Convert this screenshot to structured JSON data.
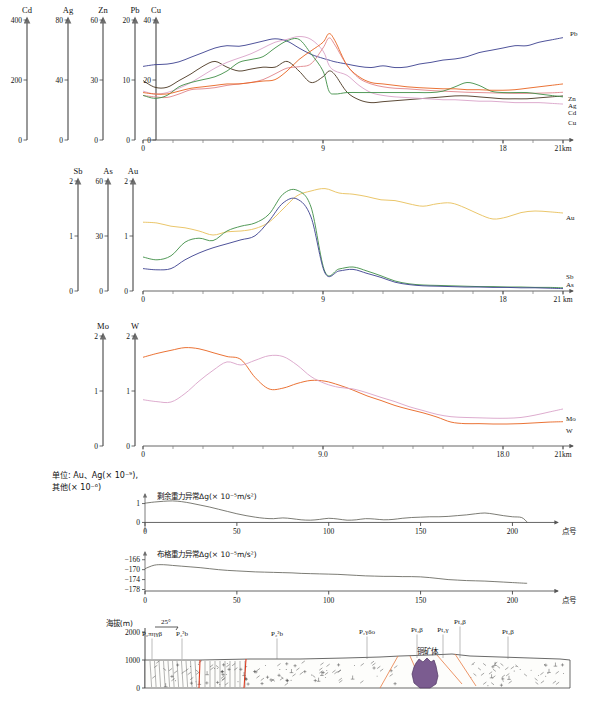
{
  "figure": {
    "units_caption_line1": "单位: Au、Ag(× 10⁻⁹),",
    "units_caption_line2": "其他(× 10⁻⁶)"
  },
  "chart_data": [
    {
      "id": "panel1",
      "type": "line",
      "title": "",
      "xlabel": "21km",
      "xlim": [
        0,
        21
      ],
      "xticks": [
        0,
        9,
        18,
        21
      ],
      "xticklabels": [
        "0",
        "9",
        "18",
        "21km"
      ],
      "grid": false,
      "legend_position": "right-inline",
      "axes": [
        {
          "name": "Cd",
          "ticks": [
            0,
            200,
            400
          ],
          "color": "#f3a6b0"
        },
        {
          "name": "Ag",
          "ticks": [
            0,
            40,
            80
          ],
          "color": "#d9a3c8"
        },
        {
          "name": "Zn",
          "ticks": [
            0,
            30,
            60
          ],
          "color": "#4a3520"
        },
        {
          "name": "Pb",
          "ticks": [
            0,
            10,
            20
          ],
          "color": "#3b3f8f"
        },
        {
          "name": "Cu",
          "ticks": [
            0,
            20,
            40
          ],
          "color": "#3f8f46"
        }
      ],
      "x": [
        0,
        0.6,
        1.2,
        1.8,
        2.4,
        3,
        3.6,
        4.2,
        4.8,
        5.4,
        6,
        6.6,
        7.2,
        7.8,
        8.4,
        9,
        9.3,
        9.6,
        10.2,
        10.8,
        11.4,
        12,
        12.6,
        13.2,
        13.8,
        14.4,
        15,
        15.6,
        16.2,
        16.8,
        17.4,
        18,
        18.6,
        19.2,
        19.8,
        20.4,
        21
      ],
      "series": [
        {
          "name": "Pb",
          "color": "#3b3f8f",
          "axis": "Pb",
          "values": [
            12.8,
            13.1,
            13.2,
            13.6,
            14.4,
            15.2,
            16.0,
            16.4,
            16.3,
            16.7,
            17.2,
            17.6,
            17.2,
            16.0,
            14.9,
            14.2,
            13.9,
            13.6,
            13.2,
            12.8,
            12.6,
            12.9,
            12.6,
            12.7,
            13.2,
            13.5,
            13.9,
            14.1,
            14.5,
            15.2,
            15.6,
            16.0,
            16.4,
            16.4,
            17.0,
            17.4,
            17.8
          ]
        },
        {
          "name": "Zn",
          "color": "#4a3520",
          "axis": "Zn",
          "values": [
            31,
            27.5,
            27.5,
            31,
            34.5,
            38.5,
            41,
            38,
            36,
            37,
            38,
            38,
            41,
            36,
            30,
            33,
            36,
            34,
            25,
            21,
            19.5,
            20,
            20.5,
            21,
            21.5,
            22,
            22.5,
            23,
            23,
            22.5,
            22,
            21.5,
            21.5,
            21.5,
            22,
            22.5,
            23
          ]
        },
        {
          "name": "Ag",
          "color": "#d9a3c8",
          "axis": "Ag",
          "values": [
            34,
            32,
            33,
            36,
            40,
            45,
            50,
            54,
            57,
            60,
            64,
            68,
            70,
            72,
            70,
            62,
            52,
            48,
            45,
            38,
            33,
            31,
            30,
            29.5,
            29,
            28.5,
            28,
            28,
            27.5,
            27,
            27,
            26.5,
            26,
            26,
            26,
            25.5,
            25
          ]
        },
        {
          "name": "Cd",
          "color": "#e0848a",
          "axis": "Cd",
          "values": [
            155,
            150,
            148,
            160,
            175,
            178,
            182,
            190,
            195,
            200,
            210,
            230,
            250,
            255,
            265,
            320,
            355,
            330,
            260,
            215,
            195,
            185,
            180,
            178,
            175,
            172,
            170,
            168,
            166,
            165,
            164,
            163,
            162,
            162,
            163,
            164,
            166
          ]
        },
        {
          "name": "Cu",
          "color": "#3f8f46",
          "axis": "Cu",
          "values": [
            15.5,
            14.5,
            15.5,
            18.5,
            20,
            21,
            22,
            24,
            27,
            28,
            29,
            32,
            34.5,
            35,
            30,
            24,
            17,
            16,
            16.5,
            16.5,
            16.5,
            16.5,
            16.5,
            16.5,
            16.5,
            16.5,
            17,
            18.5,
            20,
            19,
            17,
            16.5,
            16.5,
            16.5,
            16,
            15.5,
            15
          ]
        },
        {
          "name": "CuOrange",
          "color": "#e8631f",
          "axis": "Cu",
          "values": [
            16.5,
            16.0,
            16.0,
            17.0,
            18.0,
            18.5,
            19.0,
            19.5,
            19.5,
            20,
            20.5,
            21,
            24,
            28,
            31,
            34,
            37,
            34.5,
            26,
            22,
            20,
            19.5,
            19,
            18.5,
            18.2,
            18,
            17.8,
            17.8,
            17.5,
            17.5,
            17.3,
            17.3,
            17.5,
            18,
            18.5,
            19,
            19.5
          ]
        }
      ],
      "series_labels": [
        {
          "text": "Pb",
          "color": "#3b3f8f"
        },
        {
          "text": "Zn",
          "color": "#4a3520"
        },
        {
          "text": "Ag",
          "color": "#d9a3c8"
        },
        {
          "text": "Cd",
          "color": "#e0848a"
        },
        {
          "text": "Cu",
          "color": "#3f8f46"
        }
      ]
    },
    {
      "id": "panel2",
      "type": "line",
      "xlabel": "21 km",
      "xlim": [
        0,
        21
      ],
      "xticks": [
        0,
        9,
        18,
        21
      ],
      "xticklabels": [
        "0",
        "9",
        "18",
        "21 km"
      ],
      "grid": false,
      "axes": [
        {
          "name": "Sb",
          "ticks": [
            0,
            1,
            2
          ]
        },
        {
          "name": "As",
          "ticks": [
            0,
            30,
            60
          ]
        },
        {
          "name": "Au",
          "ticks": [
            0,
            1,
            2
          ]
        }
      ],
      "x": [
        0,
        0.7,
        1.4,
        2.1,
        2.8,
        3.5,
        4.2,
        4.9,
        5.6,
        6.3,
        7,
        7.7,
        8.4,
        9.1,
        9.8,
        10.5,
        11.2,
        11.9,
        12.6,
        13.3,
        14,
        14.7,
        15.4,
        16.1,
        16.8,
        17.5,
        18.2,
        18.9,
        19.6,
        20.3,
        21
      ],
      "series": [
        {
          "name": "Au",
          "color": "#e8c05a",
          "axis": "Au",
          "values": [
            1.72,
            1.7,
            1.62,
            1.58,
            1.5,
            1.4,
            1.48,
            1.5,
            1.56,
            1.72,
            2.05,
            2.38,
            2.5,
            2.56,
            2.45,
            2.42,
            2.36,
            2.28,
            2.26,
            2.18,
            2.12,
            2.18,
            2.2,
            2.08,
            1.92,
            1.8,
            1.85,
            1.96,
            2.0,
            1.98,
            1.95
          ]
        },
        {
          "name": "Sb",
          "color": "#3f8f46",
          "axis": "Sb",
          "values": [
            0.85,
            0.78,
            0.88,
            1.22,
            1.32,
            1.26,
            1.5,
            1.62,
            1.7,
            1.92,
            2.42,
            2.52,
            2.1,
            0.48,
            0.55,
            0.6,
            0.5,
            0.38,
            0.25,
            0.18,
            0.15,
            0.14,
            0.13,
            0.12,
            0.11,
            0.11,
            0.1,
            0.1,
            0.09,
            0.09,
            0.08
          ]
        },
        {
          "name": "As",
          "color": "#3b3f8f",
          "axis": "As",
          "values": [
            0.56,
            0.53,
            0.56,
            0.78,
            0.95,
            1.08,
            1.18,
            1.28,
            1.38,
            1.75,
            2.2,
            2.3,
            1.85,
            0.45,
            0.5,
            0.54,
            0.44,
            0.34,
            0.22,
            0.16,
            0.13,
            0.12,
            0.11,
            0.1,
            0.1,
            0.09,
            0.09,
            0.08,
            0.08,
            0.07,
            0.06
          ]
        }
      ],
      "series_labels": [
        {
          "text": "Au",
          "color": "#e8a93a"
        },
        {
          "text": "Sb",
          "color": "#3f8f46"
        },
        {
          "text": "As",
          "color": "#3b3f8f"
        }
      ]
    },
    {
      "id": "panel3",
      "type": "line",
      "xlabel": "21km",
      "xlim": [
        0,
        21
      ],
      "xticks": [
        0,
        9,
        18,
        21
      ],
      "xticklabels": [
        "0",
        "9.0",
        "18.0",
        "21km"
      ],
      "grid": false,
      "axes": [
        {
          "name": "Mo",
          "ticks": [
            0,
            1,
            2
          ]
        },
        {
          "name": "W",
          "ticks": [
            0,
            1,
            2
          ]
        }
      ],
      "x": [
        0,
        0.7,
        1.4,
        2.1,
        2.8,
        3.5,
        4.2,
        4.9,
        5.6,
        6.3,
        7,
        7.7,
        8.4,
        9.1,
        9.8,
        10.5,
        11.2,
        11.9,
        12.6,
        13.3,
        14,
        14.7,
        15.4,
        16.1,
        16.8,
        17.5,
        18.2,
        18.9,
        19.6,
        20.3,
        21
      ],
      "series": [
        {
          "name": "W",
          "color": "#e8631f",
          "axis": "W",
          "values": [
            2.3,
            2.4,
            2.48,
            2.55,
            2.52,
            2.42,
            2.32,
            2.24,
            1.78,
            1.48,
            1.5,
            1.62,
            1.7,
            1.68,
            1.58,
            1.45,
            1.3,
            1.18,
            1.05,
            0.95,
            0.86,
            0.75,
            0.62,
            0.58,
            0.58,
            0.57,
            0.57,
            0.58,
            0.6,
            0.62,
            0.63
          ]
        },
        {
          "name": "Mo",
          "color": "#d9a3c8",
          "axis": "Mo",
          "values": [
            1.2,
            1.15,
            1.14,
            1.36,
            1.68,
            1.96,
            2.18,
            2.1,
            2.22,
            2.34,
            2.32,
            2.1,
            1.8,
            1.62,
            1.52,
            1.48,
            1.38,
            1.26,
            1.15,
            1.02,
            0.92,
            0.82,
            0.76,
            0.74,
            0.73,
            0.72,
            0.72,
            0.74,
            0.8,
            0.88,
            0.96
          ]
        }
      ],
      "series_labels": [
        {
          "text": "Mo",
          "color": "#d9a3c8"
        },
        {
          "text": "W",
          "color": "#e8631f"
        }
      ]
    },
    {
      "id": "panel4",
      "type": "line",
      "title": "剩余重力异常Δg(× 10⁻⁵m/s²)",
      "xlabel": "点号",
      "xlim": [
        0,
        215
      ],
      "ylim": [
        -0.4,
        1.4
      ],
      "xticks": [
        0,
        50,
        100,
        150,
        200
      ],
      "xticklabels": [
        "0",
        "50",
        "100",
        "150",
        "200"
      ],
      "yticks": [
        0,
        1
      ],
      "yticklabels": [
        "0",
        "1"
      ],
      "grid": false,
      "series": [
        {
          "name": "residual-gravity",
          "color": "#5a5a52",
          "x": [
            0,
            5,
            10,
            15,
            20,
            25,
            30,
            35,
            40,
            45,
            50,
            55,
            60,
            65,
            70,
            75,
            80,
            85,
            90,
            95,
            100,
            105,
            110,
            115,
            120,
            125,
            130,
            135,
            140,
            145,
            150,
            155,
            160,
            165,
            170,
            175,
            180,
            185,
            190,
            195,
            200,
            205,
            208
          ],
          "values": [
            1.02,
            1.08,
            1.12,
            1.14,
            1.1,
            1.02,
            0.92,
            0.82,
            0.7,
            0.58,
            0.46,
            0.36,
            0.28,
            0.22,
            0.2,
            0.24,
            0.2,
            0.14,
            0.12,
            0.16,
            0.22,
            0.18,
            0.12,
            0.14,
            0.2,
            0.18,
            0.14,
            0.16,
            0.22,
            0.26,
            0.28,
            0.3,
            0.3,
            0.32,
            0.36,
            0.4,
            0.46,
            0.5,
            0.44,
            0.36,
            0.3,
            0.26,
            0.02
          ]
        }
      ]
    },
    {
      "id": "panel5",
      "type": "line",
      "title": "布格重力异常Δg(× 10⁻⁵m/s²)",
      "xlabel": "点号",
      "xlim": [
        0,
        215
      ],
      "ylim": [
        -179,
        -164.5
      ],
      "xticks": [
        0,
        50,
        100,
        150,
        200
      ],
      "xticklabels": [
        "0",
        "50",
        "100",
        "150",
        "200"
      ],
      "yticks": [
        -166,
        -170,
        -174,
        -178
      ],
      "yticklabels": [
        "−166",
        "−170",
        "−174",
        "−178"
      ],
      "grid": false,
      "series": [
        {
          "name": "bouguer-gravity",
          "color": "#5a5a52",
          "x": [
            0,
            5,
            10,
            15,
            20,
            25,
            30,
            35,
            40,
            45,
            50,
            55,
            60,
            65,
            70,
            75,
            80,
            85,
            90,
            95,
            100,
            105,
            110,
            115,
            120,
            125,
            130,
            135,
            140,
            145,
            150,
            155,
            160,
            165,
            170,
            175,
            180,
            185,
            190,
            195,
            200,
            205,
            208
          ],
          "values": [
            -169.6,
            -168.2,
            -168.0,
            -168.3,
            -168.6,
            -168.9,
            -169.2,
            -169.6,
            -170.0,
            -170.3,
            -170.5,
            -170.7,
            -170.9,
            -171.0,
            -171.1,
            -171.2,
            -171.3,
            -171.5,
            -171.6,
            -171.7,
            -171.8,
            -171.9,
            -172.1,
            -172.3,
            -172.5,
            -172.6,
            -172.7,
            -172.7,
            -172.8,
            -172.8,
            -172.9,
            -173.2,
            -173.6,
            -174.0,
            -174.2,
            -174.4,
            -174.5,
            -174.6,
            -174.8,
            -175.0,
            -175.2,
            -175.4,
            -175.5
          ]
        }
      ]
    }
  ],
  "cross_section": {
    "ylabel": "海拔(m)",
    "yticks": [
      "2000",
      "1000",
      "0"
    ],
    "dip_label": "25°",
    "ore_body_label": "铜矿体",
    "unit_labels": [
      {
        "text": "P₂πηγβ",
        "x": 152
      },
      {
        "text": "P₂²b",
        "x": 182
      },
      {
        "text": "P₂²b",
        "x": 277
      },
      {
        "text": "P₂γδo",
        "x": 367
      },
      {
        "text": "Pt₃β",
        "x": 417
      },
      {
        "text": "Pt₂γ",
        "x": 443
      },
      {
        "text": "Pt₃β",
        "x": 460
      },
      {
        "text": "Pt₂β",
        "x": 508
      }
    ]
  }
}
